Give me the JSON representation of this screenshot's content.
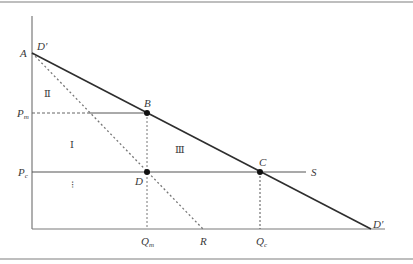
{
  "figure": {
    "type": "economics-diagram",
    "border_color": "#9a9a9a",
    "line_color": "#333333",
    "axis_color": "#7a7a7a",
    "dash_color": "#777777"
  },
  "labels": {
    "origin_top": "A",
    "demand_start": "D′",
    "demand_end": "D′",
    "point_b": "B",
    "point_c": "C",
    "point_d": "D",
    "supply": "S",
    "price_monopoly": "P",
    "price_monopoly_sub": "m",
    "price_competitive": "P",
    "price_competitive_sub": "c",
    "qty_monopoly": "Q",
    "qty_monopoly_sub": "m",
    "qty_competitive": "Q",
    "qty_competitive_sub": "c",
    "mr_intercept": "R",
    "region_1": "Ⅰ",
    "region_2": "Ⅱ",
    "region_3": "Ⅲ",
    "region_4_marker": "⁝"
  },
  "geometry": {
    "axis_x0": 32,
    "axis_y_top": 16,
    "axis_y0": 229,
    "axis_x_end": 385,
    "A": [
      32,
      53
    ],
    "B": [
      147,
      113
    ],
    "C": [
      260,
      172
    ],
    "D": [
      147,
      172
    ],
    "D_end": [
      371,
      229
    ],
    "R": [
      203,
      229
    ],
    "S_end": [
      306,
      172
    ]
  }
}
